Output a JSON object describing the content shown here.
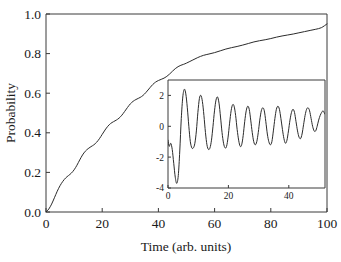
{
  "figure": {
    "background_color": "#ffffff",
    "curve_color": "#2b2b2b",
    "axis_color": "#3a3a3a"
  },
  "chart_data": [
    {
      "id": "main",
      "type": "line",
      "title": "",
      "xlabel": "Time (arb. units)",
      "ylabel": "Probability",
      "xlim": [
        0,
        100
      ],
      "ylim": [
        0,
        1.0
      ],
      "xticks": [
        0,
        20,
        40,
        60,
        80,
        100
      ],
      "yticks": [
        0.0,
        0.2,
        0.4,
        0.6,
        0.8,
        1.0
      ],
      "xtick_labels": [
        "0",
        "20",
        "40",
        "60",
        "80",
        "100"
      ],
      "ytick_labels": [
        "0.0",
        "0.2",
        "0.4",
        "0.6",
        "0.8",
        "1.0"
      ],
      "grid": false,
      "legend": "none",
      "description": "Monotonically rising saturating probability curve with small periodic ripples (staircase modulation) superimposed",
      "series": [
        {
          "name": "probability",
          "x": [
            0,
            1,
            2,
            3,
            4,
            5,
            6,
            7,
            8,
            9,
            10,
            11,
            12,
            13,
            14,
            15,
            16,
            17,
            18,
            19,
            20,
            21,
            22,
            23,
            24,
            25,
            26,
            27,
            28,
            29,
            30,
            31,
            32,
            33,
            34,
            35,
            36,
            37,
            38,
            39,
            40,
            41,
            42,
            43,
            44,
            45,
            46,
            47,
            48,
            49,
            50,
            52,
            54,
            56,
            58,
            60,
            62,
            64,
            66,
            68,
            70,
            72,
            74,
            76,
            78,
            80,
            82,
            84,
            86,
            88,
            90,
            92,
            94,
            96,
            98,
            100
          ],
          "y": [
            0.0,
            0.015,
            0.04,
            0.072,
            0.105,
            0.133,
            0.155,
            0.172,
            0.184,
            0.196,
            0.213,
            0.236,
            0.263,
            0.288,
            0.307,
            0.32,
            0.33,
            0.339,
            0.352,
            0.37,
            0.392,
            0.414,
            0.433,
            0.447,
            0.456,
            0.464,
            0.474,
            0.489,
            0.508,
            0.528,
            0.546,
            0.559,
            0.568,
            0.575,
            0.583,
            0.595,
            0.611,
            0.628,
            0.644,
            0.656,
            0.664,
            0.67,
            0.676,
            0.685,
            0.697,
            0.711,
            0.724,
            0.734,
            0.741,
            0.746,
            0.752,
            0.766,
            0.78,
            0.791,
            0.798,
            0.805,
            0.814,
            0.823,
            0.83,
            0.836,
            0.843,
            0.851,
            0.859,
            0.865,
            0.87,
            0.876,
            0.883,
            0.889,
            0.894,
            0.899,
            0.905,
            0.911,
            0.917,
            0.923,
            0.931,
            0.95
          ]
        }
      ]
    },
    {
      "id": "inset",
      "type": "line",
      "title": "",
      "xlabel": "",
      "ylabel": "",
      "xlim": [
        0,
        52
      ],
      "ylim": [
        -4,
        3
      ],
      "xticks": [
        0,
        20,
        40
      ],
      "yticks": [
        -4,
        -2,
        0,
        2
      ],
      "xtick_labels": [
        "0",
        "20",
        "40"
      ],
      "ytick_labels": [
        "-4",
        "-2",
        "0",
        "2"
      ],
      "grid": false,
      "legend": "none",
      "description": "Damped oscillation starting near -1, dipping to about -3.7, then oscillating with decaying amplitude about a slowly rising mean near +0.4",
      "series": [
        {
          "name": "oscillation",
          "x": [
            0.0,
            0.4,
            0.9,
            1.4,
            1.9,
            2.4,
            2.9,
            3.4,
            3.9,
            4.4,
            4.9,
            5.4,
            5.9,
            6.4,
            6.9,
            7.4,
            7.9,
            8.4,
            8.9,
            9.4,
            9.9,
            10.4,
            10.9,
            11.4,
            11.9,
            12.4,
            12.9,
            13.4,
            13.9,
            14.4,
            14.9,
            15.4,
            15.9,
            16.4,
            16.9,
            17.4,
            17.9,
            18.4,
            18.9,
            19.4,
            19.9,
            20.4,
            20.9,
            21.4,
            21.9,
            22.4,
            22.9,
            23.4,
            23.9,
            24.4,
            24.9,
            25.4,
            25.9,
            26.4,
            26.9,
            27.4,
            27.9,
            28.4,
            28.9,
            29.4,
            29.9,
            30.4,
            30.9,
            31.4,
            31.9,
            32.4,
            32.9,
            33.4,
            33.9,
            34.4,
            34.9,
            35.4,
            35.9,
            36.4,
            36.9,
            37.4,
            37.9,
            38.4,
            38.9,
            39.4,
            39.9,
            40.4,
            40.9,
            41.4,
            41.9,
            42.4,
            42.9,
            43.4,
            43.9,
            44.4,
            44.9,
            45.4,
            45.9,
            46.4,
            46.9,
            47.4,
            47.9,
            48.4,
            48.9,
            49.4,
            49.9,
            50.4,
            50.9,
            51.4,
            51.9
          ],
          "y": [
            -0.9,
            -1.3,
            -1.1,
            -1.5,
            -2.4,
            -3.3,
            -3.7,
            -3.2,
            -1.6,
            0.5,
            1.9,
            2.4,
            2.1,
            1.2,
            0.0,
            -1.0,
            -1.4,
            -1.4,
            -1.1,
            -0.3,
            0.9,
            1.8,
            2.0,
            1.6,
            0.7,
            -0.4,
            -1.2,
            -1.5,
            -1.4,
            -0.9,
            0.0,
            1.0,
            1.7,
            1.9,
            1.5,
            0.6,
            -0.4,
            -1.1,
            -1.4,
            -1.3,
            -0.7,
            0.2,
            1.0,
            1.4,
            1.3,
            0.7,
            -0.2,
            -0.9,
            -1.3,
            -1.2,
            -0.6,
            0.3,
            1.0,
            1.3,
            1.1,
            0.4,
            -0.4,
            -1.0,
            -1.2,
            -1.0,
            -0.4,
            0.4,
            1.0,
            1.2,
            1.0,
            0.3,
            -0.5,
            -1.0,
            -1.2,
            -1.0,
            -0.3,
            0.5,
            1.1,
            1.3,
            1.1,
            0.5,
            -0.2,
            -0.8,
            -1.1,
            -0.9,
            -0.3,
            0.4,
            0.9,
            1.1,
            0.9,
            0.3,
            -0.3,
            -0.7,
            -0.8,
            -0.5,
            0.1,
            0.7,
            1.1,
            1.2,
            1.0,
            0.5,
            0.0,
            -0.3,
            -0.3,
            0.0,
            0.4,
            0.7,
            0.9,
            1.0,
            0.8
          ]
        }
      ]
    }
  ],
  "main_axis": {
    "xlabel": "Time (arb. units)",
    "ylabel": "Probability",
    "xtick_labels": [
      "0",
      "20",
      "40",
      "60",
      "80",
      "100"
    ],
    "ytick_labels": [
      "0.0",
      "0.2",
      "0.4",
      "0.6",
      "0.8",
      "1.0"
    ]
  },
  "inset_axis": {
    "xtick_labels": [
      "0",
      "20",
      "40"
    ],
    "ytick_labels": [
      "2",
      "0",
      "-2",
      "-4"
    ]
  }
}
